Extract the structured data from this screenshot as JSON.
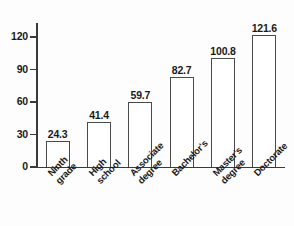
{
  "chart_data": {
    "type": "bar",
    "title": "",
    "xlabel": "",
    "ylabel": "",
    "ylim": [
      0,
      132
    ],
    "yticks": [
      0,
      30,
      60,
      90,
      120
    ],
    "ytick_labels": [
      "0",
      "30",
      "60",
      "90",
      "120"
    ],
    "grid": false,
    "legend": "none",
    "categories": [
      "Ninth grade",
      "High school",
      "Associate degree",
      "Bachelor's",
      "Master's degree",
      "Doctorate"
    ],
    "category_lines": [
      [
        "Ninth",
        "grade"
      ],
      [
        "High",
        "school"
      ],
      [
        "Associate",
        "degree"
      ],
      [
        "Bachelor's"
      ],
      [
        "Master's",
        "degree"
      ],
      [
        "Doctorate"
      ]
    ],
    "values": [
      24.3,
      41.4,
      59.7,
      82.7,
      100.8,
      121.6
    ],
    "value_labels": [
      "24.3",
      "41.4",
      "59.7",
      "82.7",
      "100.8",
      "121.6"
    ],
    "bar_style": {
      "fill": "#ffffff",
      "edge": "#4a4a4a"
    },
    "axis_color": "#3a3a3a",
    "text_color": "#1a1a1a",
    "background": "#fdfdfd"
  }
}
